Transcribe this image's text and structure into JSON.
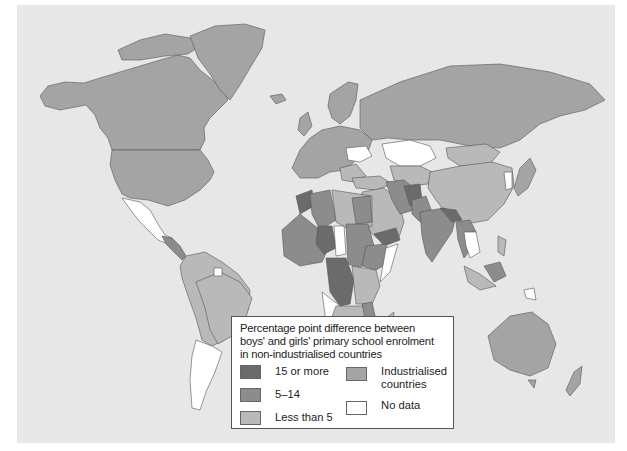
{
  "map": {
    "title": "Percentage point difference between boys' and girls' primary school enrolment in non-industrialised countries",
    "colors": {
      "ocean": "#e7e7e7",
      "fifteen_or_more": "#6b6b6b",
      "five_to_fourteen": "#8c8c8c",
      "less_than_five": "#b9b9b9",
      "industrialised": "#a4a4a4",
      "no_data": "#ffffff",
      "border": "#555555"
    }
  },
  "legend": {
    "title_line1": "Percentage point difference between",
    "title_line2": "boys' and girls' primary school enrolment",
    "title_line3": "in non-industrialised countries",
    "items": [
      {
        "label": "15 or more",
        "color": "#6b6b6b"
      },
      {
        "label": "5–14",
        "color": "#8c8c8c"
      },
      {
        "label": "Less than 5",
        "color": "#b9b9b9"
      },
      {
        "label": "Industrialised countries",
        "line1": "Industrialised",
        "line2": "countries",
        "color": "#a4a4a4"
      },
      {
        "label": "No data",
        "color": "#ffffff"
      }
    ]
  }
}
